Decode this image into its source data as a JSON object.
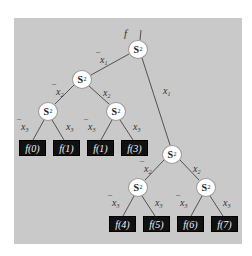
{
  "diagram": {
    "type": "binary-decision-tree",
    "background_color": "#c9c9c9",
    "node_fill": "#ffffff",
    "leaf_fill": "#111111",
    "root_label": "f",
    "node_symbol": "S",
    "node_subscript": "2",
    "nodes": [
      {
        "id": "n0",
        "label": "S",
        "sub": "2",
        "x": 138,
        "y": 49
      },
      {
        "id": "n1",
        "label": "S",
        "sub": "2",
        "x": 82,
        "y": 79
      },
      {
        "id": "n2",
        "label": "S",
        "sub": "2",
        "x": 48,
        "y": 111
      },
      {
        "id": "n3",
        "label": "S",
        "sub": "2",
        "x": 116,
        "y": 111
      },
      {
        "id": "n4",
        "label": "S",
        "sub": "2",
        "x": 172,
        "y": 154
      },
      {
        "id": "n5",
        "label": "S",
        "sub": "2",
        "x": 138,
        "y": 187
      },
      {
        "id": "n6",
        "label": "S",
        "sub": "2",
        "x": 206,
        "y": 187
      }
    ],
    "leaves": [
      {
        "id": "l0",
        "label": "f(0)",
        "x": 19,
        "y": 140
      },
      {
        "id": "l1",
        "label": "f(1)",
        "x": 53,
        "y": 140
      },
      {
        "id": "l2",
        "label": "f(1)",
        "x": 87,
        "y": 140
      },
      {
        "id": "l3",
        "label": "f(3)",
        "x": 121,
        "y": 140
      },
      {
        "id": "l4",
        "label": "f(4)",
        "x": 109,
        "y": 216
      },
      {
        "id": "l5",
        "label": "f(5)",
        "x": 143,
        "y": 216
      },
      {
        "id": "l6",
        "label": "f(6)",
        "x": 177,
        "y": 216
      },
      {
        "id": "l7",
        "label": "f(7)",
        "x": 211,
        "y": 216
      }
    ],
    "edge_labels": [
      {
        "id": "e_n0_n1",
        "neg": true,
        "var": "x",
        "sub": "1",
        "x": 96,
        "y": 55
      },
      {
        "id": "e_n0_n4",
        "neg": false,
        "var": "x",
        "sub": "1",
        "x": 163,
        "y": 86
      },
      {
        "id": "e_n1_n2",
        "neg": true,
        "var": "x",
        "sub": "2",
        "x": 52,
        "y": 87
      },
      {
        "id": "e_n1_n3",
        "neg": false,
        "var": "x",
        "sub": "2",
        "x": 103,
        "y": 88
      },
      {
        "id": "e_n2_l0",
        "neg": true,
        "var": "x",
        "sub": "3",
        "x": 17,
        "y": 122
      },
      {
        "id": "e_n2_l1",
        "neg": false,
        "var": "x",
        "sub": "3",
        "x": 66,
        "y": 122
      },
      {
        "id": "e_n3_l2",
        "neg": true,
        "var": "x",
        "sub": "3",
        "x": 84,
        "y": 122
      },
      {
        "id": "e_n3_l3",
        "neg": false,
        "var": "x",
        "sub": "3",
        "x": 133,
        "y": 122
      },
      {
        "id": "e_n4_n5",
        "neg": true,
        "var": "x",
        "sub": "2",
        "x": 140,
        "y": 164
      },
      {
        "id": "e_n4_n6",
        "neg": false,
        "var": "x",
        "sub": "2",
        "x": 193,
        "y": 164
      },
      {
        "id": "e_n5_l4",
        "neg": true,
        "var": "x",
        "sub": "3",
        "x": 108,
        "y": 198
      },
      {
        "id": "e_n5_l5",
        "neg": false,
        "var": "x",
        "sub": "3",
        "x": 155,
        "y": 198
      },
      {
        "id": "e_n6_l6",
        "neg": true,
        "var": "x",
        "sub": "3",
        "x": 176,
        "y": 198
      },
      {
        "id": "e_n6_l7",
        "neg": false,
        "var": "x",
        "sub": "3",
        "x": 223,
        "y": 198
      }
    ]
  }
}
